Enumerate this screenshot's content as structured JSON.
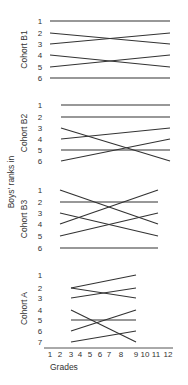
{
  "chart_data": {
    "type": "line",
    "title": "",
    "ylabel": "Boys' ranks in",
    "xlabel": "Grades",
    "x_ticks": [
      "1",
      "2",
      "3",
      "4",
      "5",
      "6",
      "7",
      "8",
      "9",
      "10",
      "11",
      "12"
    ],
    "panels": [
      {
        "name": "Cohort B1",
        "ranks": [
          "1",
          "2",
          "3",
          "4",
          "5",
          "6"
        ],
        "x_start": 1,
        "x_end": 12,
        "lines": [
          {
            "from": 1,
            "to": 1
          },
          {
            "from": 2,
            "to": 3
          },
          {
            "from": 3,
            "to": 2
          },
          {
            "from": 4,
            "to": 5
          },
          {
            "from": 5,
            "to": 4
          },
          {
            "from": 6,
            "to": 6
          }
        ]
      },
      {
        "name": "Cohort B2",
        "ranks": [
          "1",
          "2",
          "3",
          "4",
          "5",
          "6"
        ],
        "x_start": 2,
        "x_end": 12,
        "lines": [
          {
            "from": 1,
            "to": 1
          },
          {
            "from": 2,
            "to": 2
          },
          {
            "from": 3,
            "to": 6
          },
          {
            "from": 4,
            "to": 3
          },
          {
            "from": 5,
            "to": 5
          },
          {
            "from": 6,
            "to": 4
          }
        ]
      },
      {
        "name": "Cohort B3",
        "ranks": [
          "1",
          "2",
          "3",
          "4",
          "5",
          "6"
        ],
        "x_start": 2,
        "x_end": 11,
        "lines": [
          {
            "from": 1,
            "to": 4
          },
          {
            "from": 2,
            "to": 2
          },
          {
            "from": 3,
            "to": 5
          },
          {
            "from": 4,
            "to": 1
          },
          {
            "from": 5,
            "to": 3
          },
          {
            "from": 6,
            "to": 6
          }
        ]
      },
      {
        "name": "Cohort A",
        "ranks": [
          "1",
          "2",
          "3",
          "4",
          "5",
          "6",
          "7"
        ],
        "x_start": 3,
        "x_end": 9,
        "lines": [
          {
            "from": 2,
            "to": 1
          },
          {
            "from": 2,
            "to": 3
          },
          {
            "from": 3,
            "to": 2
          },
          {
            "from": 4,
            "to": 7
          },
          {
            "from": 5,
            "to": 5
          },
          {
            "from": 6,
            "to": 4
          },
          {
            "from": 7,
            "to": 6
          }
        ]
      }
    ],
    "grid": false,
    "legend": "none"
  }
}
